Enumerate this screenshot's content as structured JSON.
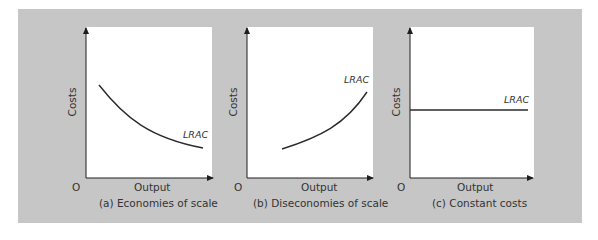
{
  "figure": {
    "panels": [
      {
        "id": "a",
        "caption": "(a) Economies of scale",
        "y_label": "Costs",
        "x_label": "Output",
        "origin_label": "O",
        "curve_label": "LRAC",
        "curve_shape": "downward-sloping convex"
      },
      {
        "id": "b",
        "caption": "(b) Diseconomies of scale",
        "y_label": "Costs",
        "x_label": "Output",
        "origin_label": "O",
        "curve_label": "LRAC",
        "curve_shape": "upward-sloping convex"
      },
      {
        "id": "c",
        "caption": "(c) Constant costs",
        "y_label": "Costs",
        "x_label": "Output",
        "origin_label": "O",
        "curve_label": "LRAC",
        "curve_shape": "horizontal"
      }
    ],
    "colors": {
      "background": "#c6c6c6",
      "plot_area": "#ffffff",
      "line": "#2a2a2a",
      "text": "#333333"
    }
  }
}
